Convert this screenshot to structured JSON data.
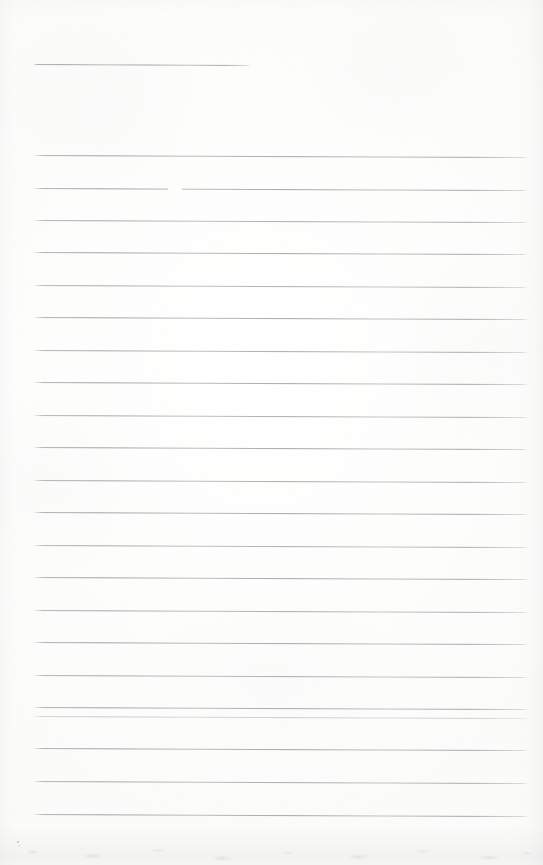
{
  "document": {
    "kind": "scanned-ruled-paper",
    "title": "Blank lined notebook page",
    "orientation": "portrait",
    "width_px": 543,
    "height_px": 865,
    "has_handwriting": false,
    "has_printed_text": false,
    "text_content": ""
  },
  "paper": {
    "background_color": "#fdfdfc",
    "tint": "warm-white",
    "edge_shadow_color": "#afafb6",
    "bottom_smudge_color": "#a8a8af"
  },
  "ruling": {
    "line_color": "#96969e",
    "line_thickness_px": 1,
    "left_margin_px": 33,
    "right_margin_px": 527,
    "nominal_spacing_px": 32.4,
    "total_lines": 24,
    "skew_note": "lines drift downward ~2px from left to right",
    "lines": [
      {
        "id": 1,
        "y": 64,
        "x_start": 33,
        "x_end": 250,
        "tilt_px": 1.0,
        "opacity": 1.0,
        "note": "short top rule"
      },
      {
        "id": 2,
        "y": 155,
        "x_start": 33,
        "x_end": 528,
        "tilt_px": 2.0,
        "opacity": 1.0,
        "note": ""
      },
      {
        "id": 3,
        "y": 188,
        "x_start": 33,
        "x_end": 528,
        "tilt_px": 2.0,
        "opacity": 1.0,
        "note": "gap near x=168-182"
      },
      {
        "id": 4,
        "y": 220,
        "x_start": 33,
        "x_end": 528,
        "tilt_px": 2.0,
        "opacity": 0.95,
        "note": ""
      },
      {
        "id": 5,
        "y": 252,
        "x_start": 33,
        "x_end": 528,
        "tilt_px": 2.0,
        "opacity": 1.0,
        "note": ""
      },
      {
        "id": 6,
        "y": 285,
        "x_start": 33,
        "x_end": 528,
        "tilt_px": 2.0,
        "opacity": 0.92,
        "note": ""
      },
      {
        "id": 7,
        "y": 317,
        "x_start": 33,
        "x_end": 528,
        "tilt_px": 2.0,
        "opacity": 1.0,
        "note": ""
      },
      {
        "id": 8,
        "y": 350,
        "x_start": 33,
        "x_end": 528,
        "tilt_px": 2.0,
        "opacity": 0.95,
        "note": ""
      },
      {
        "id": 9,
        "y": 382,
        "x_start": 33,
        "x_end": 528,
        "tilt_px": 2.0,
        "opacity": 1.0,
        "note": ""
      },
      {
        "id": 10,
        "y": 415,
        "x_start": 33,
        "x_end": 528,
        "tilt_px": 2.0,
        "opacity": 0.94,
        "note": "slight step near x=178"
      },
      {
        "id": 11,
        "y": 447,
        "x_start": 33,
        "x_end": 528,
        "tilt_px": 2.0,
        "opacity": 1.0,
        "note": ""
      },
      {
        "id": 12,
        "y": 480,
        "x_start": 33,
        "x_end": 528,
        "tilt_px": 2.0,
        "opacity": 0.96,
        "note": ""
      },
      {
        "id": 13,
        "y": 512,
        "x_start": 33,
        "x_end": 528,
        "tilt_px": 2.0,
        "opacity": 1.0,
        "note": ""
      },
      {
        "id": 14,
        "y": 545,
        "x_start": 33,
        "x_end": 528,
        "tilt_px": 2.0,
        "opacity": 0.93,
        "note": ""
      },
      {
        "id": 15,
        "y": 577,
        "x_start": 33,
        "x_end": 528,
        "tilt_px": 2.0,
        "opacity": 1.0,
        "note": ""
      },
      {
        "id": 16,
        "y": 610,
        "x_start": 33,
        "x_end": 528,
        "tilt_px": 2.0,
        "opacity": 0.95,
        "note": ""
      },
      {
        "id": 17,
        "y": 642,
        "x_start": 33,
        "x_end": 528,
        "tilt_px": 2.0,
        "opacity": 1.0,
        "note": ""
      },
      {
        "id": 18,
        "y": 675,
        "x_start": 33,
        "x_end": 528,
        "tilt_px": 2.0,
        "opacity": 0.94,
        "note": ""
      },
      {
        "id": 19,
        "y": 707,
        "x_start": 33,
        "x_end": 528,
        "tilt_px": 2.0,
        "opacity": 1.0,
        "note": ""
      },
      {
        "id": 20,
        "y": 716,
        "x_start": 33,
        "x_end": 528,
        "tilt_px": 2.0,
        "opacity": 0.55,
        "note": "very faint ghost rule"
      },
      {
        "id": 21,
        "y": 748,
        "x_start": 33,
        "x_end": 528,
        "tilt_px": 2.0,
        "opacity": 1.0,
        "note": ""
      },
      {
        "id": 22,
        "y": 781,
        "x_start": 33,
        "x_end": 528,
        "tilt_px": 2.0,
        "opacity": 0.96,
        "note": ""
      },
      {
        "id": 23,
        "y": 814,
        "x_start": 33,
        "x_end": 528,
        "tilt_px": 2.0,
        "opacity": 1.0,
        "note": ""
      }
    ]
  },
  "artifacts": {
    "specks": [
      {
        "x": 17,
        "y": 841,
        "size": 2.0
      },
      {
        "x": 19,
        "y": 845,
        "size": 1.4
      }
    ]
  }
}
